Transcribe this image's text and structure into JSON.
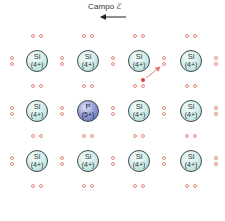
{
  "title": {
    "label": "Campo",
    "symbol": "ℰ",
    "arrow_direction": "left"
  },
  "lattice": {
    "columns_x": [
      37,
      88,
      139,
      191
    ],
    "rows_y": [
      61,
      111,
      161
    ],
    "atoms": [
      [
        {
          "element": "Si",
          "charge": "(4+)",
          "type": "si"
        },
        {
          "element": "Si",
          "charge": "(4+)",
          "type": "si"
        },
        {
          "element": "Si",
          "charge": "(4+)",
          "type": "si"
        },
        {
          "element": "Si",
          "charge": "(4+)",
          "type": "si"
        }
      ],
      [
        {
          "element": "Si",
          "charge": "(4+)",
          "type": "si"
        },
        {
          "element": "P",
          "charge": "(5+)",
          "type": "p"
        },
        {
          "element": "Si",
          "charge": "(4+)",
          "type": "si"
        },
        {
          "element": "Si",
          "charge": "(4+)",
          "type": "si"
        }
      ],
      [
        {
          "element": "Si",
          "charge": "(4+)",
          "type": "si"
        },
        {
          "element": "Si",
          "charge": "(4+)",
          "type": "si"
        },
        {
          "element": "Si",
          "charge": "(4+)",
          "type": "si"
        },
        {
          "element": "Si",
          "charge": "(4+)",
          "type": "si"
        }
      ]
    ],
    "bond_columns_x": [
      12,
      62,
      113,
      164,
      216
    ],
    "bond_rows_y": [
      36,
      86,
      136,
      186
    ]
  },
  "free_electron": {
    "x": 143,
    "y": 80,
    "arrow_to": [
      161,
      66
    ]
  },
  "colors": {
    "electron_outline": "#e58e86",
    "free_electron": "#d9413a",
    "si_fill": "#d6efec",
    "p_fill": "#8e9ad0"
  }
}
